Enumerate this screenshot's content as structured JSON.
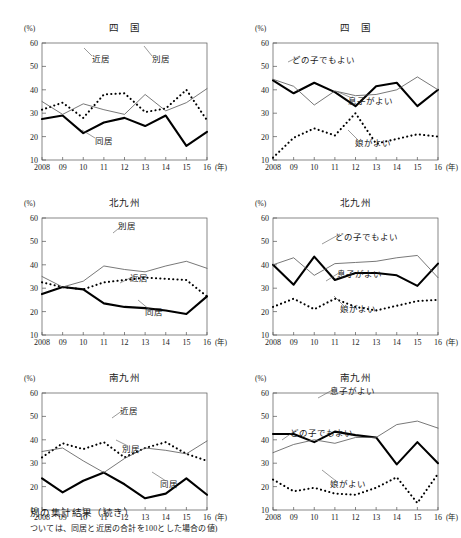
{
  "figure": {
    "unit_label": "(%)",
    "x_axis_suffix": "(年)",
    "caption_line1": "別の集計結果（続き）",
    "caption_line2": "ついては、同居と近居の合計を100とした場合の値)"
  },
  "axis": {
    "x_ticks": [
      "2008",
      "09",
      "10",
      "11",
      "12",
      "13",
      "14",
      "15",
      "16"
    ],
    "y_ticks": [
      "60",
      "50",
      "40",
      "30",
      "20",
      "10"
    ],
    "ylim": [
      10,
      60
    ],
    "xlim": [
      2008,
      2016
    ]
  },
  "colors": {
    "line_solid_thick": "#000000",
    "line_thin": "#555555",
    "line_dotted": "#000000",
    "axis": "#555555",
    "background": "#ffffff"
  },
  "chart_data": [
    {
      "id": "shikoku-left",
      "type": "line",
      "title": "四　国",
      "xlabel": "(年)",
      "ylabel": "(%)",
      "ylim": [
        10,
        60
      ],
      "grid": false,
      "legend": "inline-annotations",
      "x": [
        "2008",
        "09",
        "10",
        "11",
        "12",
        "13",
        "14",
        "15",
        "16"
      ],
      "series": [
        {
          "name": "同居",
          "style": "solid-thick",
          "values": [
            27.5,
            29.0,
            21.5,
            26.0,
            28.0,
            24.5,
            29.0,
            16.0,
            22.0
          ]
        },
        {
          "name": "近居",
          "style": "dotted",
          "values": [
            31.5,
            34.5,
            28.0,
            38.0,
            38.5,
            30.5,
            32.0,
            40.0,
            27.0
          ]
        },
        {
          "name": "別居",
          "style": "thin",
          "values": [
            35.0,
            29.5,
            34.0,
            31.5,
            29.5,
            38.0,
            31.0,
            34.5,
            40.5
          ]
        }
      ]
    },
    {
      "id": "shikoku-right",
      "type": "line",
      "title": "四　国",
      "xlabel": "(年)",
      "ylabel": "(%)",
      "ylim": [
        10,
        60
      ],
      "grid": false,
      "legend": "inline-annotations",
      "x": [
        "2008",
        "09",
        "10",
        "11",
        "12",
        "13",
        "14",
        "15",
        "16"
      ],
      "series": [
        {
          "name": "息子がよい",
          "style": "solid-thick",
          "values": [
            44.0,
            38.5,
            43.0,
            39.0,
            33.0,
            41.5,
            43.0,
            33.0,
            40.0
          ]
        },
        {
          "name": "どの子でもよい",
          "style": "thin",
          "values": [
            44.5,
            41.5,
            33.5,
            39.5,
            37.5,
            38.0,
            40.0,
            45.5,
            40.0
          ]
        },
        {
          "name": "娘がよい",
          "style": "dotted",
          "values": [
            11.0,
            19.5,
            23.5,
            20.5,
            30.0,
            17.0,
            19.0,
            21.0,
            20.0
          ]
        }
      ]
    },
    {
      "id": "kitakyushu-left",
      "type": "line",
      "title": "北九州",
      "xlabel": "(年)",
      "ylabel": "(%)",
      "ylim": [
        10,
        60
      ],
      "grid": false,
      "legend": "inline-annotations",
      "x": [
        "2008",
        "09",
        "10",
        "11",
        "12",
        "13",
        "14",
        "15",
        "16"
      ],
      "series": [
        {
          "name": "同居",
          "style": "solid-thick",
          "values": [
            27.5,
            30.5,
            29.5,
            23.5,
            22.0,
            21.5,
            20.5,
            19.0,
            26.5
          ]
        },
        {
          "name": "近居",
          "style": "dotted",
          "values": [
            32.5,
            30.5,
            29.5,
            32.5,
            33.5,
            34.5,
            34.0,
            33.5,
            26.5
          ]
        },
        {
          "name": "別居",
          "style": "thin",
          "values": [
            35.0,
            30.5,
            33.0,
            39.5,
            38.0,
            37.0,
            39.5,
            41.5,
            38.5
          ]
        }
      ]
    },
    {
      "id": "kitakyushu-right",
      "type": "line",
      "title": "北九州",
      "xlabel": "(年)",
      "ylabel": "(%)",
      "ylim": [
        10,
        60
      ],
      "grid": false,
      "legend": "inline-annotations",
      "x": [
        "2008",
        "09",
        "10",
        "11",
        "12",
        "13",
        "14",
        "15",
        "16"
      ],
      "series": [
        {
          "name": "息子がよい",
          "style": "solid-thick",
          "values": [
            40.0,
            31.5,
            43.5,
            33.5,
            36.5,
            36.5,
            35.5,
            31.0,
            40.5
          ]
        },
        {
          "name": "どの子でもよい",
          "style": "thin",
          "values": [
            40.0,
            43.0,
            35.5,
            40.5,
            41.0,
            41.5,
            43.0,
            44.0,
            34.5
          ]
        },
        {
          "name": "娘がよい",
          "style": "dotted",
          "values": [
            22.0,
            25.5,
            21.0,
            25.5,
            22.0,
            20.5,
            22.5,
            24.5,
            25.0
          ]
        }
      ]
    },
    {
      "id": "minamikyushu-left",
      "type": "line",
      "title": "南九州",
      "xlabel": "(年)",
      "ylabel": "(%)",
      "ylim": [
        10,
        60
      ],
      "grid": false,
      "legend": "inline-annotations",
      "x": [
        "2008",
        "09",
        "10",
        "11",
        "12",
        "13",
        "14",
        "15",
        "16"
      ],
      "series": [
        {
          "name": "同居",
          "style": "solid-thick",
          "values": [
            23.5,
            17.5,
            22.5,
            26.0,
            21.0,
            15.0,
            17.0,
            23.5,
            16.5
          ]
        },
        {
          "name": "近居",
          "style": "dotted",
          "values": [
            32.5,
            38.5,
            36.0,
            39.0,
            32.5,
            36.5,
            39.0,
            34.0,
            31.0
          ]
        },
        {
          "name": "別居",
          "style": "thin",
          "values": [
            35.0,
            36.5,
            31.0,
            26.0,
            32.0,
            36.5,
            35.5,
            34.0,
            39.5
          ]
        }
      ]
    },
    {
      "id": "minamikyushu-right",
      "type": "line",
      "title": "南九州",
      "xlabel": "(年)",
      "ylabel": "(%)",
      "ylim": [
        10,
        60
      ],
      "grid": false,
      "legend": "inline-annotations",
      "x": [
        "2008",
        "09",
        "10",
        "11",
        "12",
        "13",
        "14",
        "15",
        "16"
      ],
      "series": [
        {
          "name": "息子がよい",
          "style": "solid-thick",
          "values": [
            42.5,
            42.5,
            39.0,
            43.5,
            42.0,
            41.0,
            29.5,
            39.0,
            30.0
          ]
        },
        {
          "name": "どの子でもよい",
          "style": "thin",
          "values": [
            34.5,
            38.0,
            40.0,
            38.5,
            41.0,
            41.0,
            46.5,
            48.0,
            45.0
          ]
        },
        {
          "name": "娘がよい",
          "style": "dotted",
          "values": [
            23.0,
            18.0,
            19.5,
            17.0,
            16.5,
            19.5,
            24.0,
            13.0,
            25.5
          ]
        }
      ]
    }
  ],
  "annotations": {
    "shikoku-left": [
      {
        "text": "近居",
        "x": 92,
        "y": 62
      },
      {
        "text": "別居",
        "x": 152,
        "y": 62
      },
      {
        "text": "同居",
        "x": 95,
        "y": 144
      }
    ],
    "shikoku-right": [
      {
        "text": "どの子でもよい",
        "x": 292,
        "y": 63
      },
      {
        "text": "息子がよい",
        "x": 348,
        "y": 104
      },
      {
        "text": "娘がよい",
        "x": 355,
        "y": 146
      }
    ],
    "kitakyushu-left": [
      {
        "text": "別居",
        "x": 118,
        "y": 229
      },
      {
        "text": "近居",
        "x": 130,
        "y": 281
      },
      {
        "text": "同居",
        "x": 145,
        "y": 315
      }
    ],
    "kitakyushu-right": [
      {
        "text": "どの子でもよい",
        "x": 335,
        "y": 240
      },
      {
        "text": "息子がよい",
        "x": 337,
        "y": 277
      },
      {
        "text": "娘がよい",
        "x": 340,
        "y": 312
      }
    ],
    "minamikyushu-left": [
      {
        "text": "近居",
        "x": 120,
        "y": 414
      },
      {
        "text": "別居",
        "x": 122,
        "y": 452
      },
      {
        "text": "同居",
        "x": 160,
        "y": 487
      }
    ],
    "minamikyushu-right": [
      {
        "text": "息子がよい",
        "x": 330,
        "y": 394
      },
      {
        "text": "どの子でもよい",
        "x": 290,
        "y": 436
      },
      {
        "text": "娘がよい",
        "x": 330,
        "y": 487
      }
    ]
  }
}
